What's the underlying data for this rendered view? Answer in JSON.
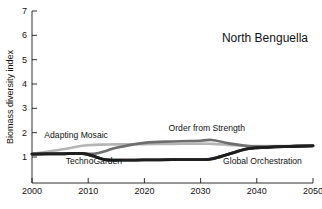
{
  "chart_data": {
    "type": "line",
    "title": "North Benguella",
    "xlabel": "",
    "ylabel": "Biomass diversity index",
    "xlim": [
      2000,
      2050
    ],
    "ylim": [
      0.35,
      7
    ],
    "xticks": [
      2000,
      2010,
      2020,
      2030,
      2040,
      2050
    ],
    "yticks": [
      1,
      2,
      3,
      4,
      5,
      6,
      7
    ],
    "grid": false,
    "legend_position": "inline-labels",
    "x": [
      2000,
      2005,
      2009,
      2011,
      2013,
      2015,
      2020,
      2025,
      2030,
      2032,
      2035,
      2038,
      2040,
      2045,
      2050
    ],
    "series": [
      {
        "name": "Adapting Mosaic",
        "color": "#b5b5b5",
        "values": [
          1.12,
          1.3,
          1.46,
          1.5,
          1.51,
          1.52,
          1.53,
          1.54,
          1.55,
          1.54,
          1.5,
          1.46,
          1.45,
          1.45,
          1.46
        ]
      },
      {
        "name": "Order from Strength",
        "color": "#6e6e6e",
        "values": [
          1.12,
          1.14,
          1.15,
          1.13,
          1.24,
          1.38,
          1.58,
          1.64,
          1.67,
          1.7,
          1.56,
          1.46,
          1.43,
          1.44,
          1.46
        ]
      },
      {
        "name": "TechnoGarden",
        "color": "#1e1e1e",
        "values": [
          1.12,
          1.13,
          1.14,
          1.03,
          0.89,
          0.87,
          0.88,
          0.89,
          0.89,
          0.92,
          1.12,
          1.32,
          1.38,
          1.43,
          1.46
        ]
      },
      {
        "name": "Global Orchestration",
        "color": "#1e1e1e",
        "values": [
          1.12,
          1.13,
          1.14,
          1.03,
          0.89,
          0.87,
          0.88,
          0.89,
          0.89,
          0.92,
          1.12,
          1.32,
          1.38,
          1.43,
          1.46
        ]
      }
    ],
    "annotations": [
      {
        "text": "Adapting Mosaic",
        "x": 2002.2,
        "y": 1.77
      },
      {
        "text": "TechnoGarden",
        "x": 2006.0,
        "y": 0.7
      },
      {
        "text": "Order from Strength",
        "x": 2024.3,
        "y": 2.08
      },
      {
        "text": "Global Orchestration",
        "x": 2034.0,
        "y": 0.7
      }
    ]
  }
}
